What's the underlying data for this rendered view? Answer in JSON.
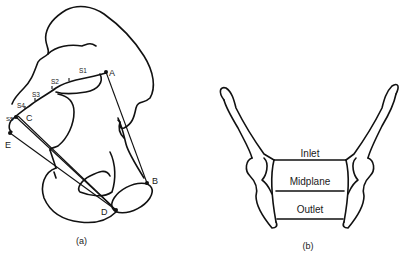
{
  "figure_a": {
    "caption": "(a)",
    "points": {
      "A": "A",
      "B": "B",
      "C": "C",
      "D": "D",
      "E": "E"
    },
    "sacral_vertebrae": [
      "S1",
      "S2",
      "S3",
      "S4",
      "S5"
    ],
    "lines": [
      "A-B",
      "C-D",
      "E-D"
    ]
  },
  "figure_b": {
    "caption": "(b)",
    "planes": {
      "inlet": "Inlet",
      "midplane": "Midplane",
      "outlet": "Outlet"
    }
  },
  "colors": {
    "line": "#111111",
    "background": "#ffffff"
  }
}
